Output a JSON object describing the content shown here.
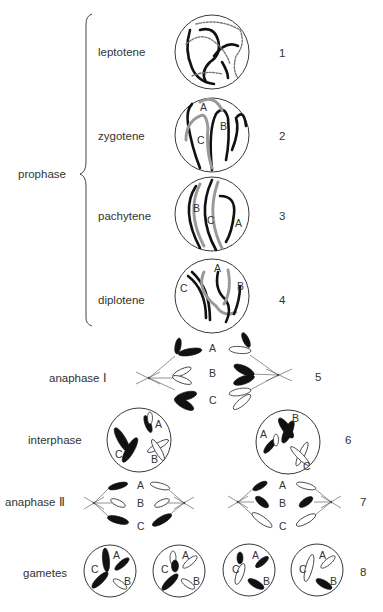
{
  "figure": {
    "group_label": "prophase",
    "stages": [
      {
        "label": "leptotene",
        "number": "1"
      },
      {
        "label": "zygotene",
        "number": "2"
      },
      {
        "label": "pachytene",
        "number": "3"
      },
      {
        "label": "diplotene",
        "number": "4"
      },
      {
        "label": "anaphase Ⅰ",
        "number": "5"
      },
      {
        "label": "interphase",
        "number": "6"
      },
      {
        "label": "anaphase Ⅱ",
        "number": "7"
      },
      {
        "label": "gametes",
        "number": "8"
      }
    ],
    "chromosome_letters": {
      "a": "A",
      "b": "B",
      "c": "C"
    }
  }
}
